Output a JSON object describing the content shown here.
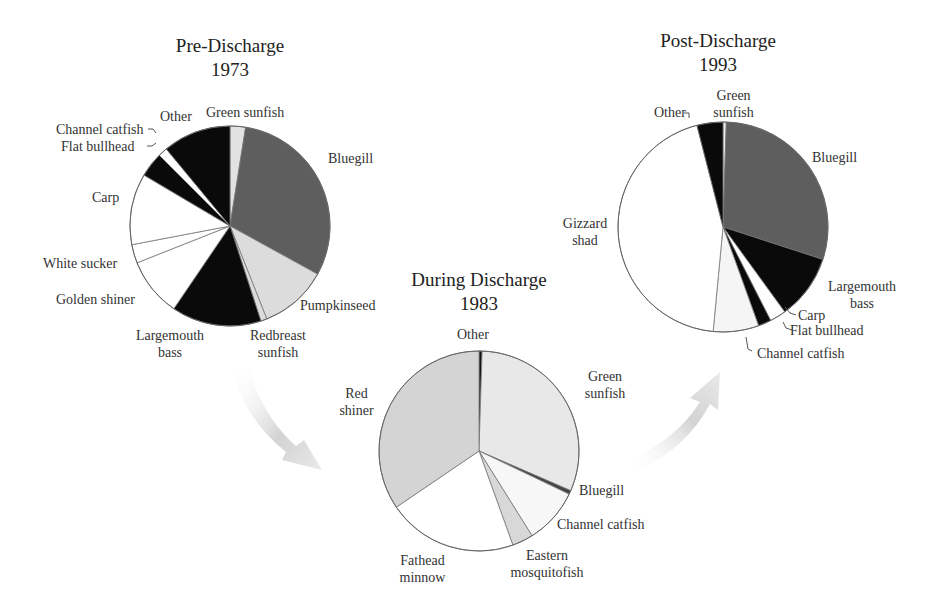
{
  "chart_data": [
    {
      "type": "pie",
      "title": "Pre-Discharge",
      "subtitle": "1973",
      "center": [
        230,
        226
      ],
      "radius": 100,
      "slices": [
        {
          "label": "Green sunfish",
          "value": 2.5,
          "color": "#e2e2e2"
        },
        {
          "label": "Bluegill",
          "value": 30.5,
          "color": "#5e5e5e"
        },
        {
          "label": "Pumpkinseed",
          "value": 11,
          "color": "#dcdcdc"
        },
        {
          "label": "Redbreast sunfish",
          "value": 1,
          "color": "#dcdcdc"
        },
        {
          "label": "Largemouth bass",
          "value": 14.5,
          "color": "#0a0a0a"
        },
        {
          "label": "Golden shiner",
          "value": 9.5,
          "color": "#ffffff"
        },
        {
          "label": "White sucker",
          "value": 3,
          "color": "#ffffff"
        },
        {
          "label": "Carp",
          "value": 11.5,
          "color": "#ffffff"
        },
        {
          "label": "Flat bullhead",
          "value": 4,
          "color": "#0a0a0a"
        },
        {
          "label": "Channel catfish",
          "value": 1.5,
          "color": "#ffffff"
        },
        {
          "label": "Other",
          "value": 11,
          "color": "#0a0a0a"
        }
      ]
    },
    {
      "type": "pie",
      "title": "During Discharge",
      "subtitle": "1983",
      "center": [
        479,
        451
      ],
      "radius": 100,
      "slices": [
        {
          "label": "Other",
          "value": 0.5,
          "color": "#111111"
        },
        {
          "label": "Green sunfish",
          "value": 31,
          "color": "#e8e8e8"
        },
        {
          "label": "Bluegill",
          "value": 0.6,
          "color": "#444444"
        },
        {
          "label": "Channel catfish",
          "value": 9,
          "color": "#f7f7f7"
        },
        {
          "label": "Eastern mosquitofish",
          "value": 3.4,
          "color": "#d8d8d8"
        },
        {
          "label": "Fathead minnow",
          "value": 21,
          "color": "#ffffff"
        },
        {
          "label": "Red shiner",
          "value": 34.5,
          "color": "#d4d4d4"
        }
      ]
    },
    {
      "type": "pie",
      "title": "Post-Discharge",
      "subtitle": "1993",
      "center": [
        723,
        227
      ],
      "radius": 105,
      "slices": [
        {
          "label": "Green sunfish",
          "value": 0.5,
          "color": "#f0f0f0"
        },
        {
          "label": "Bluegill",
          "value": 29.5,
          "color": "#5e5e5e"
        },
        {
          "label": "Largemouth bass",
          "value": 10,
          "color": "#0a0a0a"
        },
        {
          "label": "Carp",
          "value": 2.5,
          "color": "#ffffff"
        },
        {
          "label": "Flat bullhead",
          "value": 2,
          "color": "#0a0a0a"
        },
        {
          "label": "Channel catfish",
          "value": 7,
          "color": "#f5f5f5"
        },
        {
          "label": "Gizzard shad",
          "value": 44.5,
          "color": "#ffffff"
        },
        {
          "label": "Other",
          "value": 4,
          "color": "#0a0a0a"
        }
      ]
    }
  ],
  "titles": {
    "pre": {
      "line1": "Pre-Discharge",
      "line2": "1973"
    },
    "during": {
      "line1": "During Discharge",
      "line2": "1983"
    },
    "post": {
      "line1": "Post-Discharge",
      "line2": "1993"
    }
  },
  "labels": {
    "pre": {
      "green_sunfish": "Green sunfish",
      "other": "Other",
      "channel_catfish": "Channel catfish",
      "flat_bullhead": "Flat bullhead",
      "bluegill": "Bluegill",
      "carp": "Carp",
      "white_sucker": "White sucker",
      "golden_shiner": "Golden shiner",
      "pumpkinseed": "Pumpkinseed",
      "largemouth_1": "Largemouth",
      "largemouth_2": "bass",
      "redbreast_1": "Redbreast",
      "redbreast_2": "sunfish"
    },
    "during": {
      "other": "Other",
      "green_1": "Green",
      "green_2": "sunfish",
      "red_1": "Red",
      "red_2": "shiner",
      "bluegill": "Bluegill",
      "channel_catfish": "Channel catfish",
      "fathead_1": "Fathead",
      "fathead_2": "minnow",
      "eastern_1": "Eastern",
      "eastern_2": "mosquitofish"
    },
    "post": {
      "green_1": "Green",
      "green_2": "sunfish",
      "other": "Other",
      "bluegill": "Bluegill",
      "gizzard_1": "Gizzard",
      "gizzard_2": "shad",
      "largemouth_1": "Largemouth",
      "largemouth_2": "bass",
      "carp": "Carp",
      "flat_bullhead": "Flat bullhead",
      "channel_catfish": "Channel catfish"
    }
  }
}
